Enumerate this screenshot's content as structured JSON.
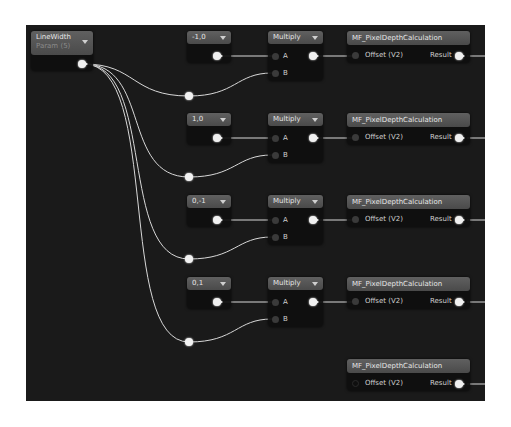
{
  "graph": {
    "param_node": {
      "title": "LineWidth",
      "subtitle": "Param (5)"
    },
    "rows": [
      {
        "constant": "-1,0",
        "multiply": "Multiply",
        "pin_a": "A",
        "pin_b": "B",
        "function": "MF_PixelDepthCalculation",
        "input": "Offset (V2)",
        "output": "Result"
      },
      {
        "constant": "1,0",
        "multiply": "Multiply",
        "pin_a": "A",
        "pin_b": "B",
        "function": "MF_PixelDepthCalculation",
        "input": "Offset (V2)",
        "output": "Result"
      },
      {
        "constant": "0,-1",
        "multiply": "Multiply",
        "pin_a": "A",
        "pin_b": "B",
        "function": "MF_PixelDepthCalculation",
        "input": "Offset (V2)",
        "output": "Result"
      },
      {
        "constant": "0,1",
        "multiply": "Multiply",
        "pin_a": "A",
        "pin_b": "B",
        "function": "MF_PixelDepthCalculation",
        "input": "Offset (V2)",
        "output": "Result"
      }
    ],
    "extra_function": {
      "function": "MF_PixelDepthCalculation",
      "input": "Offset (V2)",
      "output": "Result"
    }
  },
  "colors": {
    "canvas_bg": "#1a1a1a",
    "node_header": "#555555",
    "wire": "#d8d8d8",
    "pin_connected": "#f0f0f0",
    "pin_unconnected": "#3a3a3a"
  }
}
